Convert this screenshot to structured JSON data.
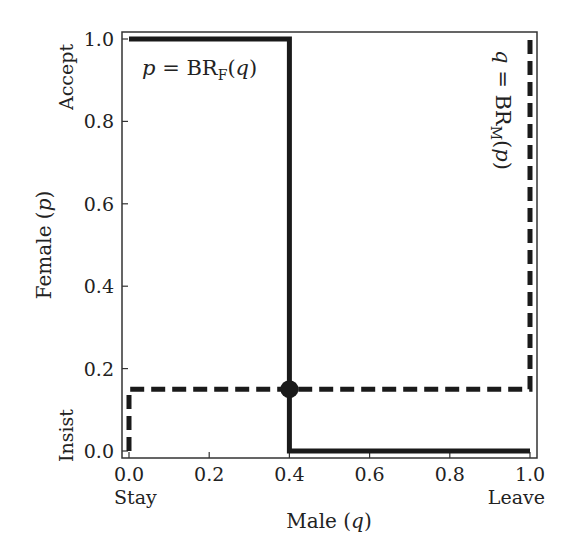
{
  "chart_data": {
    "type": "line",
    "title": "",
    "xlabel": "Male (q)",
    "ylabel": "Female (p)",
    "xlim": [
      0.0,
      1.0
    ],
    "ylim": [
      0.0,
      1.0
    ],
    "grid": false,
    "legend": null,
    "x_ticks": [
      "0.0",
      "0.2",
      "0.4",
      "0.6",
      "0.8",
      "1.0"
    ],
    "y_ticks": [
      "0.0",
      "0.2",
      "0.4",
      "0.6",
      "0.8",
      "1.0"
    ],
    "x_end_labels": {
      "min": "Stay",
      "max": "Leave"
    },
    "y_end_labels": {
      "min": "Insist",
      "max": "Accept"
    },
    "series": [
      {
        "name": "p = BR_F(q)",
        "style": "solid",
        "color": "#1a1a1a",
        "x": [
          0.0,
          0.4,
          0.4,
          1.0
        ],
        "y": [
          1.0,
          1.0,
          0.0,
          0.0
        ]
      },
      {
        "name": "q = BR_M(p)",
        "style": "dashed",
        "color": "#1a1a1a",
        "x": [
          0.0,
          0.0,
          1.0,
          1.0
        ],
        "y": [
          0.0,
          0.15,
          0.15,
          1.0
        ]
      }
    ],
    "annotations": [
      {
        "text": "p = BR_F(q)",
        "position": "top-left, inside axes"
      },
      {
        "text": "q = BR_M(p)",
        "position": "right side, rotated 90° clockwise"
      }
    ],
    "equilibrium_point": {
      "x": 0.4,
      "y": 0.15,
      "marker": "filled circle"
    }
  },
  "labels": {
    "xlabel_text": "Male (",
    "xlabel_var": "q",
    "ylabel_text": "Female (",
    "ylabel_var": "p",
    "close_paren": ")",
    "stay": "Stay",
    "leave": "Leave",
    "insist": "Insist",
    "accept": "Accept",
    "annot_f_var": "p",
    "annot_f_eq": " = BR",
    "annot_f_sub": "F",
    "annot_f_arg_open": "(",
    "annot_f_arg": "q",
    "annot_f_arg_close": ")",
    "annot_m_var": "q",
    "annot_m_eq": " = BR",
    "annot_m_sub": "M",
    "annot_m_arg_open": "(",
    "annot_m_arg": "p",
    "annot_m_arg_close": ")"
  },
  "x_ticks": [
    "0.0",
    "0.2",
    "0.4",
    "0.6",
    "0.8",
    "1.0"
  ],
  "y_ticks": [
    "0.0",
    "0.2",
    "0.4",
    "0.6",
    "0.8",
    "1.0"
  ]
}
